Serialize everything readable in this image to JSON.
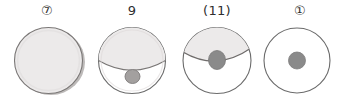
{
  "figure": {
    "background_color": "#ffffff",
    "outline_color": "#6b6b6b",
    "shade_fill_color": "#eceaea",
    "shade_edge_color": "#c9c6c6",
    "dot_color": "#8a8a8a",
    "dot_edge_color": "#6f6f6f",
    "label_color": "#2e2e2e",
    "panel_count": 4
  },
  "panels": [
    {
      "label": "⑦",
      "label_text": "7",
      "label_style": "circled-number",
      "circle": {
        "shading": "full",
        "divider": "none",
        "dot": "none",
        "shadow": "bottom-right-rim"
      }
    },
    {
      "label": "9",
      "label_text": "9",
      "label_style": "plain-handwritten",
      "circle": {
        "shading": "upper-two-thirds",
        "divider": "arc-bowing-down",
        "dot": "below-divider",
        "shadow": "none"
      }
    },
    {
      "label": "(11)",
      "label_text": "11",
      "label_style": "parenthesized",
      "circle": {
        "shading": "upper-third",
        "divider": "arc-bowing-down",
        "dot": "straddling-divider",
        "shadow": "none"
      }
    },
    {
      "label": "①",
      "label_text": "1",
      "label_style": "circled-number",
      "circle": {
        "shading": "none",
        "divider": "none",
        "dot": "center",
        "shadow": "none"
      }
    }
  ]
}
